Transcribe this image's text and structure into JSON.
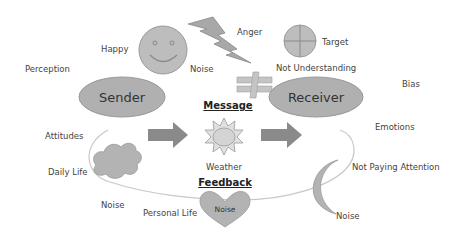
{
  "nodes": {
    "sender": "Sender",
    "receiver": "Receiver",
    "message": "Message",
    "feedback": "Feedback"
  },
  "labels": {
    "perception": "Perception",
    "happy": "Happy",
    "noise_face": "Noise",
    "anger": "Anger",
    "target": "Target",
    "not_understanding": "Not Understanding",
    "bias": "Bias",
    "attitudes": "Attitudes",
    "emotions": "Emotions",
    "weather": "Weather",
    "daily_life": "Daily Life",
    "noise_cloud": "Noise",
    "personal_life": "Personal Life",
    "noise_heart": "Noise",
    "not_paying_attention": "Not Paying Attention",
    "noise_moon": "Noise"
  },
  "colors": {
    "shape_fill": "#b3b3b3",
    "shape_stroke": "#8c8c8c",
    "arrow_fill": "#8a8a8a",
    "curve": "#c8c8c8"
  }
}
